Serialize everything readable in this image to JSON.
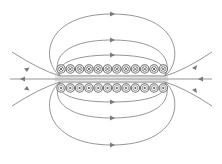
{
  "diagram": {
    "colors": {
      "field_line": "#8a8a8a",
      "arrow": "#7a7a7a",
      "coil": "#6e6e6e",
      "background": "#ffffff"
    },
    "coils": {
      "count_per_row": 12,
      "top_row": {
        "symbol": "cross",
        "meaning": "current into page",
        "y": 69,
        "x_start": 61,
        "spacing": 9.3
      },
      "bottom_row": {
        "symbol": "dot",
        "meaning": "current out of page",
        "y": 88,
        "x_start": 61,
        "spacing": 9.3
      }
    },
    "field_lines": {
      "inside_direction": "right-to-left",
      "outside_direction": "left-to-right",
      "count_top_loops": 3,
      "count_bottom_loops": 3,
      "axial_lines": 3
    }
  }
}
